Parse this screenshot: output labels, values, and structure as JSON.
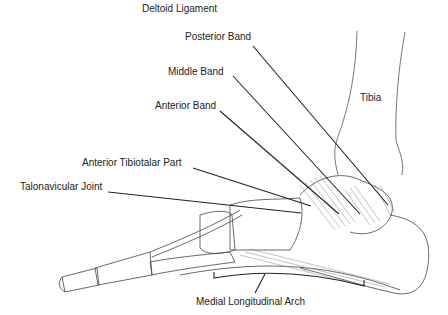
{
  "title": "Deltoid Ligament",
  "labels": {
    "posterior_band": "Posterior Band",
    "middle_band": "Middle Band",
    "anterior_band": "Anterior Band",
    "tibia": "Tibia",
    "anterior_tibiotalar_part": "Anterior Tibiotalar Part",
    "talonavicular_joint": "Talonavicular Joint",
    "medial_longitudinal_arch": "Medial Longitudinal Arch"
  },
  "colors": {
    "line": "#222222",
    "bone": "#444444",
    "ligament": "#777777"
  }
}
